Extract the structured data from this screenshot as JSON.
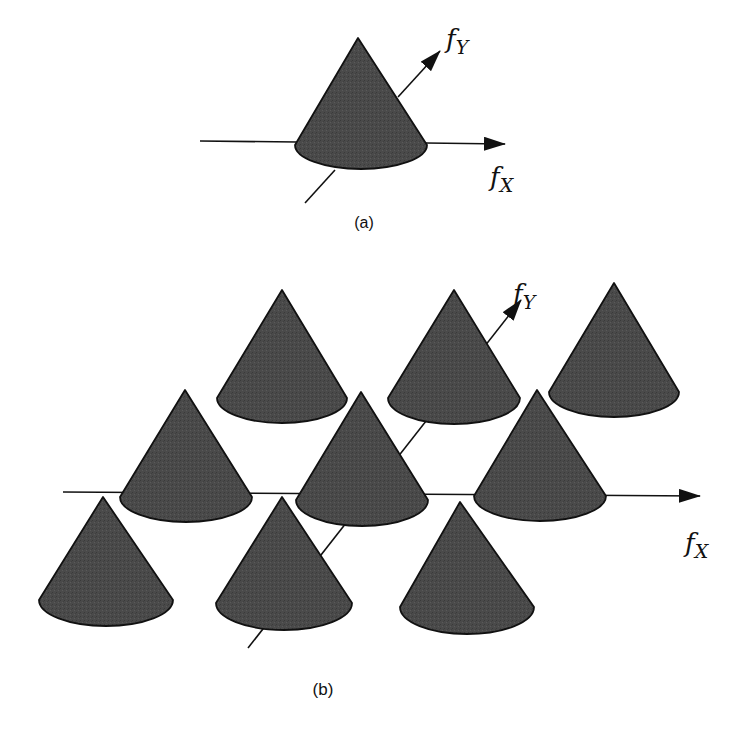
{
  "figure": {
    "colors": {
      "cone_fill": "#4a4a4a",
      "cone_stroke": "#111111",
      "axis": "#111111",
      "background": "#ffffff"
    },
    "panel_a": {
      "caption": "(a)",
      "fx_label": {
        "main": "f",
        "sub": "X"
      },
      "fy_label": {
        "main": "f",
        "sub": "Y"
      },
      "cones": [
        {
          "apex_x": 358,
          "apex_y": 38,
          "base_cx": 361,
          "base_cy": 145,
          "rx": 66,
          "ry": 24
        }
      ]
    },
    "panel_b": {
      "caption": "(b)",
      "fx_label": {
        "main": "f",
        "sub": "X"
      },
      "fy_label": {
        "main": "f",
        "sub": "Y"
      },
      "cones": [
        {
          "row": "back",
          "apex_x": 282,
          "apex_y": 290,
          "base_cx": 282,
          "base_cy": 398,
          "rx": 65,
          "ry": 25
        },
        {
          "row": "back",
          "apex_x": 454,
          "apex_y": 290,
          "base_cx": 454,
          "base_cy": 398,
          "rx": 66,
          "ry": 26
        },
        {
          "row": "back",
          "apex_x": 614,
          "apex_y": 283,
          "base_cx": 614,
          "base_cy": 392,
          "rx": 65,
          "ry": 25
        },
        {
          "row": "middle",
          "apex_x": 185,
          "apex_y": 390,
          "base_cx": 186,
          "base_cy": 497,
          "rx": 66,
          "ry": 25
        },
        {
          "row": "middle",
          "apex_x": 361,
          "apex_y": 392,
          "base_cx": 362,
          "base_cy": 500,
          "rx": 66,
          "ry": 26
        },
        {
          "row": "middle",
          "apex_x": 537,
          "apex_y": 390,
          "base_cx": 540,
          "base_cy": 496,
          "rx": 66,
          "ry": 25
        },
        {
          "row": "front",
          "apex_x": 103,
          "apex_y": 497,
          "base_cx": 106,
          "base_cy": 600,
          "rx": 67,
          "ry": 26
        },
        {
          "row": "front",
          "apex_x": 282,
          "apex_y": 497,
          "base_cx": 284,
          "base_cy": 603,
          "rx": 68,
          "ry": 27
        },
        {
          "row": "front",
          "apex_x": 460,
          "apex_y": 502,
          "base_cx": 467,
          "base_cy": 607,
          "rx": 67,
          "ry": 27
        }
      ]
    }
  }
}
